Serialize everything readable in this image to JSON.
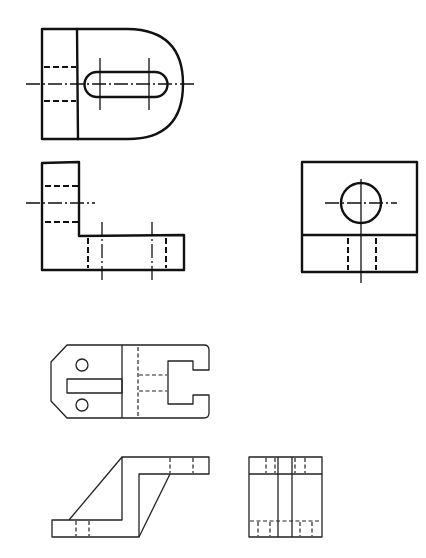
{
  "figure": {
    "background": "#ffffff",
    "line_color": "#111111"
  },
  "part_a": {
    "label": "",
    "views": [
      {
        "name": "top-view",
        "features": [
          "rounded D-shaped end",
          "obround slot",
          "hidden lines",
          "centerlines"
        ]
      },
      {
        "name": "front-view",
        "features": [
          "L-shaped profile",
          "hidden hole lines",
          "centerlines"
        ]
      },
      {
        "name": "side-view",
        "features": [
          "square outline",
          "circular hole",
          "hidden lines",
          "centerlines"
        ]
      }
    ]
  },
  "part_b": {
    "label": "",
    "views": [
      {
        "name": "top-view",
        "features": [
          "chamfered left end",
          "two small circles",
          "rectangular slot",
          "C-notch right end",
          "hidden lines"
        ]
      },
      {
        "name": "front-view",
        "features": [
          "Z-shaped offset profile",
          "hidden hole lines"
        ]
      },
      {
        "name": "side-view",
        "features": [
          "rectangular outline",
          "vertical lines",
          "hidden lines"
        ]
      }
    ]
  }
}
